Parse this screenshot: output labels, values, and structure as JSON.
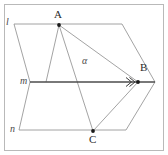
{
  "figure": {
    "width": 168,
    "height": 155,
    "background_color": "#ffffff",
    "frame_color": "#b9b9b9",
    "stroke_color": "#8c8c8c",
    "emphasis_stroke_color": "#4d4d4d",
    "point_color": "#1a1a1a",
    "label_color": "#2b2b2b"
  },
  "points": [
    {
      "id": "A",
      "label": "A",
      "x": 59,
      "y": 25,
      "label_x": 55,
      "label_y": 10
    },
    {
      "id": "B",
      "label": "B",
      "x": 138,
      "y": 82,
      "label_x": 139,
      "label_y": 64
    },
    {
      "id": "C",
      "label": "C",
      "x": 93,
      "y": 131,
      "label_x": 89,
      "label_y": 134
    }
  ],
  "lines": [
    {
      "id": "l",
      "label": "l",
      "label_x": 6,
      "label_y": 18
    },
    {
      "id": "m",
      "label": "m",
      "label_x": 20,
      "label_y": 77
    },
    {
      "id": "n",
      "label": "n",
      "label_x": 10,
      "label_y": 125
    }
  ],
  "planes": [
    {
      "id": "alpha",
      "label": "α",
      "label_x": 83,
      "label_y": 57
    }
  ],
  "segments": [
    {
      "id": "l-top-edge",
      "from": "l-left",
      "to": "l-right",
      "x1": 14,
      "y1": 24,
      "x2": 122,
      "y2": 24,
      "emphasis": false
    },
    {
      "id": "upper-left-edge",
      "from": "l-left",
      "to": "m-left",
      "x1": 14,
      "y1": 24,
      "x2": 30,
      "y2": 82,
      "emphasis": false
    },
    {
      "id": "upper-right-edge",
      "from": "l-right",
      "to": "m-right",
      "x1": 122,
      "y1": 24,
      "x2": 155,
      "y2": 82,
      "emphasis": false
    },
    {
      "id": "m-line",
      "from": "m-left",
      "to": "m-right",
      "x1": 30,
      "y1": 82,
      "x2": 155,
      "y2": 82,
      "emphasis": true
    },
    {
      "id": "lower-left-edge",
      "from": "m-left",
      "to": "n-left",
      "x1": 30,
      "y1": 82,
      "x2": 19,
      "y2": 130,
      "emphasis": false
    },
    {
      "id": "lower-right-edge",
      "from": "m-right",
      "to": "n-right",
      "x1": 155,
      "y1": 82,
      "x2": 126,
      "y2": 130,
      "emphasis": false
    },
    {
      "id": "n-line",
      "from": "n-left",
      "to": "n-right",
      "x1": 19,
      "y1": 130,
      "x2": 126,
      "y2": 130,
      "emphasis": false
    },
    {
      "id": "A-to-B",
      "from": "A",
      "to": "B",
      "x1": 59,
      "y1": 25,
      "x2": 138,
      "y2": 82,
      "emphasis": false
    },
    {
      "id": "A-to-C",
      "from": "A",
      "to": "C",
      "x1": 59,
      "y1": 25,
      "x2": 93,
      "y2": 131,
      "emphasis": false
    },
    {
      "id": "A-to-m",
      "from": "A",
      "to": "m-point",
      "x1": 59,
      "y1": 25,
      "x2": 46,
      "y2": 82,
      "emphasis": false
    },
    {
      "id": "B-to-C",
      "from": "B",
      "to": "C",
      "x1": 138,
      "y1": 82,
      "x2": 93,
      "y2": 131,
      "emphasis": false
    }
  ],
  "markers": [
    {
      "id": "arrow-on-m",
      "type": "double-chevron",
      "x": 131,
      "y": 82
    }
  ]
}
